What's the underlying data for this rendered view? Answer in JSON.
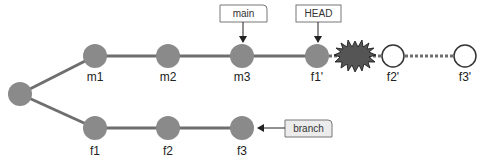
{
  "diagram": {
    "colors": {
      "commit_fill": "#8a8a8a",
      "edge": "#6e6e6e",
      "pending_fill": "#ffffff",
      "pending_stroke": "#333333",
      "conflict_fill": "#555555",
      "tag_stroke": "#777777",
      "tag_fill_default": "#ffffff",
      "tag_fill_branch": "#ececec"
    },
    "commits": {
      "root": {
        "label": ""
      },
      "m1": {
        "label": "m1"
      },
      "m2": {
        "label": "m2"
      },
      "m3": {
        "label": "m3"
      },
      "f1p": {
        "label": "f1'"
      },
      "f2p": {
        "label": "f2'"
      },
      "f3p": {
        "label": "f3'"
      },
      "f1": {
        "label": "f1"
      },
      "f2": {
        "label": "f2"
      },
      "f3": {
        "label": "f3"
      }
    },
    "refs": {
      "main": {
        "label": "main",
        "points_to": "m3"
      },
      "head": {
        "label": "HEAD",
        "points_to": "f1'"
      },
      "branch": {
        "label": "branch",
        "points_to": "f3"
      }
    },
    "conflict": {
      "icon": "conflict-starburst-icon",
      "between": [
        "f1'",
        "f2'"
      ]
    }
  }
}
